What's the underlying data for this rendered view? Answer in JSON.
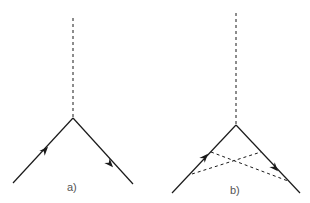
{
  "diagrams": [
    {
      "label": "a)"
    },
    {
      "label": "b)"
    }
  ],
  "colors": {
    "line": "#1a1a1a",
    "label": "#555555",
    "background": "#ffffff"
  }
}
